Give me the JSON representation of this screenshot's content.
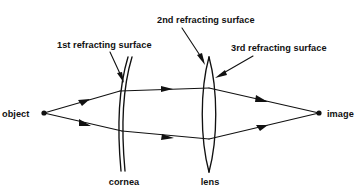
{
  "figure": {
    "type": "optical-ray-diagram",
    "background_color": "#ffffff",
    "ink_color": "#111111",
    "width": 363,
    "height": 192
  },
  "labels": {
    "object": "object",
    "image": "image",
    "cornea": "cornea",
    "lens": "lens",
    "surface_1": "1st refracting surface",
    "surface_2": "2nd refracting surface",
    "surface_3": "3rd refracting surface"
  },
  "points": {
    "object": {
      "x": 44,
      "y": 113
    },
    "image": {
      "x": 319,
      "y": 113
    }
  },
  "optics": {
    "cornea": {
      "name": "cornea",
      "description": "two near-parallel curved arcs forming a meniscus shell",
      "x_center": 124,
      "top_y": 57,
      "bottom_y": 171
    },
    "lens": {
      "name": "lens",
      "description": "thin biconvex lens with pointed tips",
      "x_center": 209,
      "top_y": 57,
      "bottom_y": 172
    }
  },
  "annotations": [
    {
      "id": "surface-1",
      "text": "1st refracting surface",
      "text_x": 57,
      "text_y": 48,
      "leader_from": {
        "x": 112,
        "y": 53
      },
      "leader_to": {
        "x": 122,
        "y": 80
      }
    },
    {
      "id": "surface-2",
      "text": "2nd refracting surface",
      "text_x": 157,
      "text_y": 23,
      "leader_from": {
        "x": 183,
        "y": 28
      },
      "leader_to": {
        "x": 204,
        "y": 62
      }
    },
    {
      "id": "surface-3",
      "text": "3rd refracting surface",
      "text_x": 230,
      "text_y": 51,
      "leader_from": {
        "x": 252,
        "y": 57
      },
      "leader_to": {
        "x": 218,
        "y": 76
      }
    }
  ],
  "rays": {
    "count": 2,
    "upper": {
      "segments": [
        {
          "from": {
            "x": 44,
            "y": 113
          },
          "to": {
            "x": 120,
            "y": 91
          }
        },
        {
          "from": {
            "x": 120,
            "y": 91
          },
          "to": {
            "x": 209,
            "y": 88
          }
        },
        {
          "from": {
            "x": 209,
            "y": 88
          },
          "to": {
            "x": 319,
            "y": 113
          }
        }
      ],
      "arrow_positions": [
        {
          "x": 84,
          "y": 101
        },
        {
          "x": 167,
          "y": 89
        },
        {
          "x": 262,
          "y": 100
        }
      ]
    },
    "lower": {
      "segments": [
        {
          "from": {
            "x": 44,
            "y": 113
          },
          "to": {
            "x": 122,
            "y": 131
          }
        },
        {
          "from": {
            "x": 122,
            "y": 131
          },
          "to": {
            "x": 209,
            "y": 139
          }
        },
        {
          "from": {
            "x": 209,
            "y": 139
          },
          "to": {
            "x": 319,
            "y": 113
          }
        }
      ],
      "arrow_positions": [
        {
          "x": 85,
          "y": 123
        },
        {
          "x": 168,
          "y": 137
        },
        {
          "x": 262,
          "y": 127
        }
      ]
    }
  }
}
